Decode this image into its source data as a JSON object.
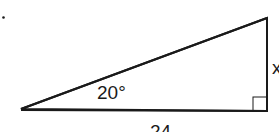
{
  "figure": {
    "type": "right-triangle",
    "marker": ".",
    "angle_label": "20°",
    "adjacent_label": "24",
    "opposite_label": "x",
    "stroke_color": "#1a1a1a",
    "background": "#ffffff"
  }
}
